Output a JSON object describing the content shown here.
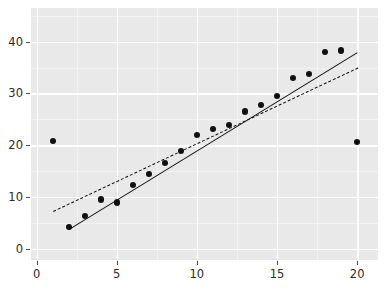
{
  "chart_data": {
    "type": "scatter",
    "title": "",
    "subtitle": "",
    "xlabel": "",
    "ylabel": "",
    "xlim": [
      -0.35,
      21.3
    ],
    "ylim": [
      -2.2,
      46.5
    ],
    "grid": true,
    "legend": null,
    "xticks": [
      0,
      5,
      10,
      15,
      20
    ],
    "xticklabels": [
      "0",
      "5",
      "10",
      "15",
      "20"
    ],
    "yticks": [
      0,
      10,
      20,
      30,
      40
    ],
    "yticklabels": [
      "0",
      "10",
      "20",
      "30",
      "40"
    ],
    "x_minor_ticks": [
      2.5,
      7.5,
      12.5,
      17.5
    ],
    "y_minor_ticks": [
      5,
      15,
      25,
      35,
      45
    ],
    "points": [
      {
        "x": 1,
        "y": 20.8,
        "outlier": true
      },
      {
        "x": 2,
        "y": 4.1,
        "outlier": false
      },
      {
        "x": 3,
        "y": 6.3,
        "outlier": false
      },
      {
        "x": 4,
        "y": 9.5,
        "outlier": false
      },
      {
        "x": 5,
        "y": 8.9,
        "outlier": false
      },
      {
        "x": 6,
        "y": 12.3,
        "outlier": false
      },
      {
        "x": 7,
        "y": 14.4,
        "outlier": false
      },
      {
        "x": 8,
        "y": 16.5,
        "outlier": false
      },
      {
        "x": 9,
        "y": 18.8,
        "outlier": false
      },
      {
        "x": 10,
        "y": 22.0,
        "outlier": false
      },
      {
        "x": 11,
        "y": 23.1,
        "outlier": false
      },
      {
        "x": 12,
        "y": 23.9,
        "outlier": false
      },
      {
        "x": 13,
        "y": 26.5,
        "outlier": false
      },
      {
        "x": 14,
        "y": 27.8,
        "outlier": false
      },
      {
        "x": 15,
        "y": 29.5,
        "outlier": false
      },
      {
        "x": 16,
        "y": 33.0,
        "outlier": false
      },
      {
        "x": 17,
        "y": 33.8,
        "outlier": false
      },
      {
        "x": 18,
        "y": 38.0,
        "outlier": false
      },
      {
        "x": 19,
        "y": 38.3,
        "outlier": false
      },
      {
        "x": 20,
        "y": 20.6,
        "outlier": true
      }
    ],
    "lines": [
      {
        "name": "solid-fit-line",
        "style": "solid",
        "color": "#101010",
        "x0": 2.0,
        "y0": 3.8,
        "x1": 20.0,
        "y1": 38.0
      },
      {
        "name": "dashed-fit-line",
        "style": "dashed",
        "color": "#101010",
        "x0": 1.0,
        "y0": 7.3,
        "x1": 20.0,
        "y1": 35.0
      }
    ],
    "point_radius_px": 3.1,
    "panel_background": "#e9e9e9",
    "grid_color": "#ffffff",
    "point_color": "#101010"
  },
  "panel": {
    "left_px": 31,
    "top_px": 8,
    "width_px": 347,
    "height_px": 252
  }
}
